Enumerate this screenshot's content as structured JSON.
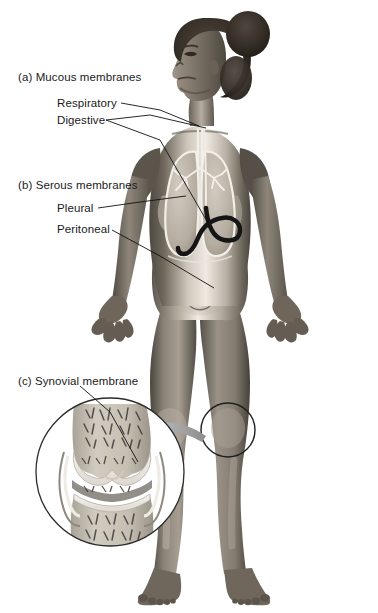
{
  "figure": {
    "background_color": "#ffffff",
    "text_color": "#1a1a1a",
    "leader_line_color": "#101010",
    "arrow_color": "#9a9a9a",
    "inset_outline_color": "#2b2b2b"
  },
  "labels": {
    "group_a": "(a) Mucous membranes",
    "respiratory": "Respiratory",
    "digestive": "Digestive",
    "group_b": "(b) Serous membranes",
    "pleural": "Pleural",
    "peritoneal": "Peritoneal",
    "group_c": "(c) Synovial membrane"
  },
  "body_figure": {
    "pose": "standing, facing viewer, head turned in left profile, arms slightly out with open hands",
    "hair": "dark hair gathered in a bun at the back of the head",
    "skin_tone_mid": "#8c8378",
    "skin_tone_light": "#efe9e2",
    "skin_tone_shadow": "#55504a"
  },
  "organs": {
    "trachea": "trachea and bronchial tree",
    "lungs": "left and right lungs outlined in white",
    "stomach": "stomach and duodenum drawn as a dark curved tube",
    "esophagus": "esophagus descending from the throat",
    "lung_fill": "#b9b2a8",
    "organ_outline": "#f4f1ec",
    "digestive_tract_color": "#1b1b1b"
  },
  "inset": {
    "name": "synovial knee joint cross-section",
    "contents": "femur and tibia with articular cartilage, joint cavity, synovial membrane and trabecular spongy bone",
    "frame_shape": "circle",
    "callout_circle_target": "right knee of the figure",
    "bone_fill": "#c9c3b8",
    "cartilage_fill": "#efece6",
    "trabecular_color": "#3a3a3a"
  }
}
